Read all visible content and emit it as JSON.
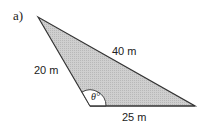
{
  "diagram": {
    "part_label": "a)",
    "sides": {
      "left": "20 m",
      "top": "40 m",
      "bottom": "25 m"
    },
    "angle_label": "θ°",
    "colors": {
      "fill": "#c8c8c8",
      "stroke": "#333333",
      "angle_fill": "#ffffff"
    }
  }
}
